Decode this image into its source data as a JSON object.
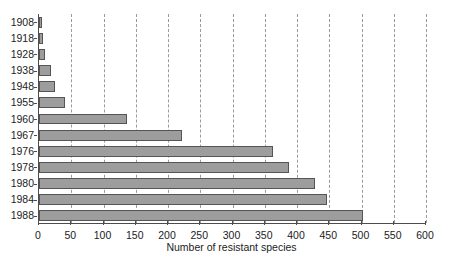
{
  "chart_data": {
    "type": "bar",
    "orientation": "horizontal",
    "title": "",
    "xlabel": "Number of resistant species",
    "ylabel": "",
    "categories": [
      "1908",
      "1918",
      "1928",
      "1938",
      "1948",
      "1955",
      "1960",
      "1967",
      "1976",
      "1978",
      "1980",
      "1984",
      "1988"
    ],
    "values": [
      4,
      6,
      10,
      18,
      25,
      40,
      137,
      222,
      363,
      388,
      428,
      447,
      502
    ],
    "xlim": [
      0,
      600
    ],
    "ylim": null,
    "xticks": [
      0,
      50,
      100,
      150,
      200,
      250,
      300,
      350,
      400,
      450,
      500,
      550,
      600
    ],
    "xticklabels": [
      "0",
      "50",
      "100",
      "150",
      "200",
      "250",
      "300",
      "350",
      "400",
      "450",
      "500",
      "550",
      "600"
    ],
    "grid": "vertical-dashed",
    "legend": null,
    "bar_color": "#9d9d9d",
    "bar_edge_color": "#555555",
    "axis_color": "#4d4d4d",
    "grid_color": "#9a9a9a",
    "background": "#ffffff"
  }
}
